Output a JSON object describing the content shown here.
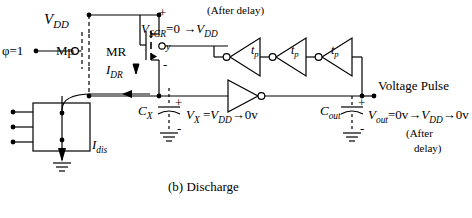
{
  "figure": {
    "caption": "(b)  Discharge"
  },
  "supply": {
    "vdd_label": "VDD",
    "vdd_name": "V",
    "vdd_sub": "DD"
  },
  "clock": {
    "label": "φ=1"
  },
  "transistors": {
    "mp": {
      "label": "Mp",
      "state": "off-dashed"
    },
    "mr": {
      "label": "MR",
      "state": "on",
      "gate_node": "y"
    }
  },
  "currents": {
    "idr": {
      "name": "I",
      "sub": "DR",
      "label": "IDR"
    },
    "idis": {
      "name": "I",
      "sub": "dis",
      "label": "Idis"
    }
  },
  "nodes": {
    "vsgr": {
      "expr": "VSGR=0 →VDD",
      "name": "V",
      "sub": "SGR",
      "rest": "=0 →",
      "tail_name": "V",
      "tail_sub": "DD"
    },
    "vx": {
      "expr": "VX =VDD→0v",
      "name": "V",
      "sub": "X",
      "rest": " =",
      "tail_name": "V",
      "tail_sub": "DD",
      "tail_rest": "→0v"
    },
    "vout": {
      "expr": "Vout=0v→VDD→0v",
      "name": "V",
      "sub": "out",
      "rest": "=0v→",
      "tail_name": "V",
      "tail_sub": "DD",
      "tail_rest": "→0v"
    },
    "polarity_plus": "+",
    "polarity_minus": "-"
  },
  "capacitors": {
    "cx": {
      "name": "C",
      "sub": "X",
      "label": "CX"
    },
    "cout": {
      "name": "C",
      "sub": "out",
      "label": "Cout"
    }
  },
  "annotations": {
    "after_delay_top": "(After delay)",
    "after_line1": "(After",
    "after_line2": "delay)"
  },
  "delay_chain": {
    "elements": [
      {
        "label": "tp",
        "name": "t",
        "sub": "p"
      },
      {
        "label": "tp",
        "name": "t",
        "sub": "p"
      },
      {
        "label": "tp",
        "name": "t",
        "sub": "p"
      }
    ]
  },
  "output": {
    "label": "Voltage Pulse"
  },
  "colors": {
    "wire": "#000000",
    "background": "#ffffff",
    "dashed": "#000000"
  }
}
